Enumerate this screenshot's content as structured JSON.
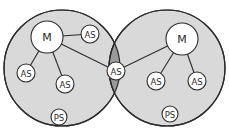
{
  "diagram": {
    "type": "overlapping-network-clusters",
    "colors": {
      "cluster_fill": "#d9d9d9",
      "overlap_fill": "#9a9a9a",
      "node_fill": "#ffffff",
      "stroke": "#2a2a2a"
    },
    "clusters": [
      {
        "id": "left",
        "cx": 62,
        "cy": 68,
        "r": 58
      },
      {
        "id": "right",
        "cx": 167,
        "cy": 68,
        "r": 58
      }
    ],
    "nodes": [
      {
        "id": "m1",
        "label": "M",
        "cx": 47,
        "cy": 37,
        "r": 16,
        "cluster": "left"
      },
      {
        "id": "as1",
        "label": "AS",
        "cx": 90,
        "cy": 34,
        "r": 9,
        "cluster": "left"
      },
      {
        "id": "as2",
        "label": "AS",
        "cx": 26,
        "cy": 73,
        "r": 9,
        "cluster": "left"
      },
      {
        "id": "as3",
        "label": "AS",
        "cx": 65,
        "cy": 84,
        "r": 9,
        "cluster": "left"
      },
      {
        "id": "ps1",
        "label": "PS",
        "cx": 59,
        "cy": 117,
        "r": 8,
        "cluster": "left"
      },
      {
        "id": "as_shared",
        "label": "AS",
        "cx": 116,
        "cy": 71,
        "r": 9,
        "cluster": "both"
      },
      {
        "id": "m2",
        "label": "M",
        "cx": 182,
        "cy": 39,
        "r": 16,
        "cluster": "right"
      },
      {
        "id": "as4",
        "label": "AS",
        "cx": 156,
        "cy": 81,
        "r": 9,
        "cluster": "right"
      },
      {
        "id": "as5",
        "label": "AS",
        "cx": 197,
        "cy": 81,
        "r": 9,
        "cluster": "right"
      },
      {
        "id": "ps2",
        "label": "PS",
        "cx": 170,
        "cy": 114,
        "r": 8,
        "cluster": "right"
      }
    ],
    "edges": [
      [
        "m1",
        "as1"
      ],
      [
        "m1",
        "as2"
      ],
      [
        "m1",
        "as3"
      ],
      [
        "m1",
        "as_shared"
      ],
      [
        "m2",
        "as_shared"
      ],
      [
        "m2",
        "as4"
      ],
      [
        "m2",
        "as5"
      ]
    ]
  }
}
